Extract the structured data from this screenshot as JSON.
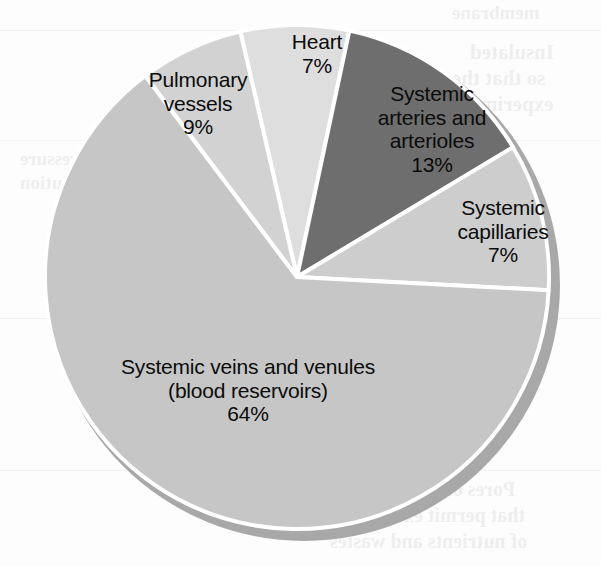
{
  "chart_data": {
    "type": "pie",
    "title": "",
    "subtitle": "",
    "xlabel": "",
    "ylabel": "",
    "legend_position": "none",
    "labels_inside": true,
    "units": "percent of total blood volume",
    "total": 100,
    "categories": [
      "Heart",
      "Systemic arteries and arterioles",
      "Systemic capillaries",
      "Systemic veins and venules (blood reservoirs)",
      "Pulmonary vessels"
    ],
    "values": [
      7,
      13,
      7,
      64,
      9
    ],
    "slices": [
      {
        "id": "heart",
        "name": "Heart",
        "label_lines": [
          "Heart"
        ],
        "value": 7,
        "percent_text": "7%",
        "color": "#dedede",
        "start_angle_deg": -13,
        "end_angle_deg": 12
      },
      {
        "id": "systemic-arteries",
        "name": "Systemic arteries and arterioles",
        "label_lines": [
          "Systemic",
          "arteries and",
          "arterioles"
        ],
        "value": 13,
        "percent_text": "13%",
        "color": "#6e6e6e",
        "start_angle_deg": 12,
        "end_angle_deg": 59
      },
      {
        "id": "systemic-capillaries",
        "name": "Systemic capillaries",
        "label_lines": [
          "Systemic",
          "capillaries"
        ],
        "value": 7,
        "percent_text": "7%",
        "color": "#cdcdcd",
        "start_angle_deg": 59,
        "end_angle_deg": 93
      },
      {
        "id": "systemic-veins",
        "name": "Systemic veins and venules (blood reservoirs)",
        "label_lines": [
          "Systemic veins and venules",
          "(blood reservoirs)"
        ],
        "value": 64,
        "percent_text": "64%",
        "color": "#c6c6c6",
        "start_angle_deg": 93,
        "end_angle_deg": 323
      },
      {
        "id": "pulmonary-vessels",
        "name": "Pulmonary vessels",
        "label_lines": [
          "Pulmonary",
          "vessels"
        ],
        "value": 9,
        "percent_text": "9%",
        "color": "#d2d2d2",
        "start_angle_deg": 323,
        "end_angle_deg": 347
      }
    ],
    "style": {
      "separator_color": "#ffffff",
      "shadow_color": "#a8a8a8",
      "background_color": "#fdfdfd",
      "label_text_color": "#0b0b0b",
      "center_x": 297,
      "center_y": 277,
      "radius": 252
    }
  },
  "background_artifacts": {
    "description": "faint mirrored show-through text from the reverse of the scanned page",
    "fragments": [
      {
        "text": "membrane",
        "x": 452,
        "y": 2,
        "size": 19
      },
      {
        "text": "Insulated",
        "x": 470,
        "y": 40,
        "size": 21
      },
      {
        "text": "so that the",
        "x": 452,
        "y": 66,
        "size": 21
      },
      {
        "text": "experiment",
        "x": 452,
        "y": 92,
        "size": 21
      },
      {
        "text": "Tends to",
        "x": 214,
        "y": 40,
        "size": 19
      },
      {
        "text": "a certain",
        "x": 318,
        "y": 40,
        "size": 19
      },
      {
        "text": "between",
        "x": 452,
        "y": 150,
        "size": 19
      },
      {
        "text": "the solute",
        "x": 452,
        "y": 172,
        "size": 19
      },
      {
        "text": "and water",
        "x": 452,
        "y": 194,
        "size": 19
      },
      {
        "text": "pressure",
        "x": 20,
        "y": 148,
        "size": 19
      },
      {
        "text": "solution",
        "x": 20,
        "y": 172,
        "size": 19
      },
      {
        "text": "Permits",
        "x": 452,
        "y": 322,
        "size": 19
      },
      {
        "text": "diffusion",
        "x": 452,
        "y": 348,
        "size": 19
      },
      {
        "text": "Pores of a minute size",
        "x": 330,
        "y": 478,
        "size": 20
      },
      {
        "text": "that permit exchange",
        "x": 344,
        "y": 504,
        "size": 20
      },
      {
        "text": "of nutrients and wastes",
        "x": 330,
        "y": 530,
        "size": 20
      }
    ]
  }
}
